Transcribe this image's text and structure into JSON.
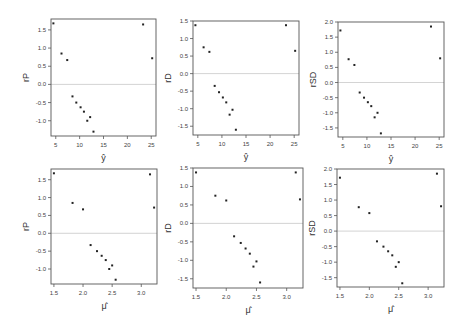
{
  "figure": {
    "width": 469,
    "height": 327,
    "colors": {
      "frame": "#555555",
      "points": "#222222",
      "zero_line": "#c8c8c8",
      "text": "#444444"
    }
  },
  "chart_data": [
    {
      "type": "scatter",
      "panel": "top-left",
      "xlabel": "ŷ",
      "ylabel": "rP",
      "xlim": [
        4,
        26
      ],
      "ylim": [
        -1.42,
        1.8
      ],
      "xticks": [
        5,
        10,
        15,
        20,
        25
      ],
      "xtick_labels": [
        "5",
        "10",
        "15",
        "20",
        "25"
      ],
      "yticks": [
        1.5,
        1.0,
        0.5,
        0.0,
        -0.5,
        -1.0
      ],
      "ytick_labels": [
        "1.5",
        "1.0",
        "0.5",
        "0.0",
        "-0.5",
        "-1.0"
      ],
      "reference_line_y": 0,
      "frame": {
        "left": 51,
        "top": 19,
        "right": 156,
        "bottom": 136
      },
      "x": [
        4.5,
        6.2,
        7.4,
        8.5,
        9.3,
        10.2,
        10.9,
        11.6,
        12.2,
        12.9,
        23.3,
        25.2
      ],
      "y": [
        1.68,
        0.85,
        0.67,
        -0.33,
        -0.5,
        -0.63,
        -0.75,
        -1.0,
        -0.9,
        -1.3,
        1.65,
        0.72
      ]
    },
    {
      "type": "scatter",
      "panel": "top-middle",
      "xlabel": "ŷ",
      "ylabel": "rD",
      "xlim": [
        4,
        26
      ],
      "ylim": [
        -1.75,
        1.5
      ],
      "xticks": [
        5,
        10,
        15,
        20,
        25
      ],
      "xtick_labels": [
        "5",
        "10",
        "15",
        "20",
        "25"
      ],
      "yticks": [
        1.5,
        1.0,
        0.5,
        0.0,
        -0.5,
        -1.0,
        -1.5
      ],
      "ytick_labels": [
        "1.5",
        "1.0",
        "0.5",
        "0.0",
        "-0.5",
        "-1.0",
        "-1.5"
      ],
      "reference_line_y": 0,
      "frame": {
        "left": 193,
        "top": 21,
        "right": 299,
        "bottom": 135
      },
      "x": [
        4.5,
        6.2,
        7.4,
        8.5,
        9.4,
        10.2,
        10.9,
        11.6,
        12.2,
        12.9,
        23.3,
        25.2
      ],
      "y": [
        1.38,
        0.75,
        0.62,
        -0.35,
        -0.53,
        -0.68,
        -0.82,
        -1.17,
        -1.03,
        -1.6,
        1.38,
        0.65
      ]
    },
    {
      "type": "scatter",
      "panel": "top-right",
      "xlabel": "ŷ",
      "ylabel": "rSD",
      "xlim": [
        4,
        26
      ],
      "ylim": [
        -1.8,
        2.0
      ],
      "xticks": [
        5,
        10,
        15,
        20,
        25
      ],
      "xtick_labels": [
        "5",
        "10",
        "15",
        "20",
        "25"
      ],
      "yticks": [
        2.0,
        1.5,
        1.0,
        0.5,
        0.0,
        -0.5,
        -1.0,
        -1.5
      ],
      "ytick_labels": [
        "2.0",
        "1.5",
        "1.0",
        "0.5",
        "0.0",
        "-0.5",
        "-1.0",
        "-1.5"
      ],
      "reference_line_y": 0,
      "frame": {
        "left": 338,
        "top": 22,
        "right": 444,
        "bottom": 137
      },
      "x": [
        4.5,
        6.2,
        7.4,
        8.5,
        9.4,
        10.2,
        10.9,
        11.6,
        12.2,
        12.9,
        23.3,
        25.2
      ],
      "y": [
        1.72,
        0.77,
        0.58,
        -0.33,
        -0.5,
        -0.65,
        -0.78,
        -1.15,
        -1.0,
        -1.68,
        1.85,
        0.8
      ]
    },
    {
      "type": "scatter",
      "panel": "bottom-left",
      "xlabel": "μ̂",
      "ylabel": "rP",
      "xlim": [
        1.45,
        3.27
      ],
      "ylim": [
        -1.42,
        1.8
      ],
      "xticks": [
        1.5,
        2.0,
        2.5,
        3.0
      ],
      "xtick_labels": [
        "1.5",
        "2.0",
        "2.5",
        "3.0"
      ],
      "yticks": [
        1.5,
        1.0,
        0.5,
        0.0,
        -0.5,
        -1.0
      ],
      "ytick_labels": [
        "1.5",
        "1.0",
        "0.5",
        "0.0",
        "-0.5",
        "-1.0"
      ],
      "reference_line_y": 0,
      "frame": {
        "left": 51,
        "top": 169,
        "right": 157,
        "bottom": 284
      },
      "x": [
        1.5,
        1.82,
        2.0,
        2.13,
        2.24,
        2.32,
        2.39,
        2.45,
        2.5,
        2.56,
        3.15,
        3.22
      ],
      "y": [
        1.68,
        0.85,
        0.67,
        -0.33,
        -0.5,
        -0.63,
        -0.75,
        -1.0,
        -0.9,
        -1.3,
        1.65,
        0.72
      ]
    },
    {
      "type": "scatter",
      "panel": "bottom-middle",
      "xlabel": "μ̂",
      "ylabel": "rD",
      "xlim": [
        1.45,
        3.27
      ],
      "ylim": [
        -1.75,
        1.5
      ],
      "xticks": [
        1.5,
        2.0,
        2.5,
        3.0
      ],
      "xtick_labels": [
        "1.5",
        "2.0",
        "2.5",
        "3.0"
      ],
      "yticks": [
        1.5,
        1.0,
        0.5,
        0.0,
        -0.5,
        -1.0,
        -1.5
      ],
      "ytick_labels": [
        "1.5",
        "1.0",
        "0.5",
        "0.0",
        "-0.5",
        "-1.0",
        "-1.5"
      ],
      "reference_line_y": 0,
      "frame": {
        "left": 193,
        "top": 168,
        "right": 303,
        "bottom": 288
      },
      "x": [
        1.5,
        1.82,
        2.0,
        2.13,
        2.24,
        2.32,
        2.39,
        2.45,
        2.5,
        2.56,
        3.15,
        3.22
      ],
      "y": [
        1.38,
        0.75,
        0.62,
        -0.35,
        -0.53,
        -0.68,
        -0.82,
        -1.17,
        -1.03,
        -1.6,
        1.38,
        0.65
      ]
    },
    {
      "type": "scatter",
      "panel": "bottom-right",
      "xlabel": "μ̂",
      "ylabel": "rSD",
      "xlim": [
        1.45,
        3.27
      ],
      "ylim": [
        -1.8,
        2.0
      ],
      "xticks": [
        1.5,
        2.0,
        2.5,
        3.0
      ],
      "xtick_labels": [
        "1.5",
        "2.0",
        "2.5",
        "3.0"
      ],
      "yticks": [
        2.0,
        1.5,
        1.0,
        0.5,
        0.0,
        -0.5,
        -1.0,
        -1.5
      ],
      "ytick_labels": [
        "2.0",
        "1.5",
        "1.0",
        "0.5",
        "0.0",
        "-0.5",
        "-1.0",
        "-1.5"
      ],
      "reference_line_y": 0,
      "frame": {
        "left": 337,
        "top": 169,
        "right": 444,
        "bottom": 287
      },
      "x": [
        1.5,
        1.82,
        2.0,
        2.13,
        2.24,
        2.32,
        2.39,
        2.45,
        2.5,
        2.56,
        3.15,
        3.22
      ],
      "y": [
        1.72,
        0.77,
        0.58,
        -0.33,
        -0.5,
        -0.65,
        -0.78,
        -1.15,
        -1.0,
        -1.68,
        1.85,
        0.8
      ]
    }
  ]
}
